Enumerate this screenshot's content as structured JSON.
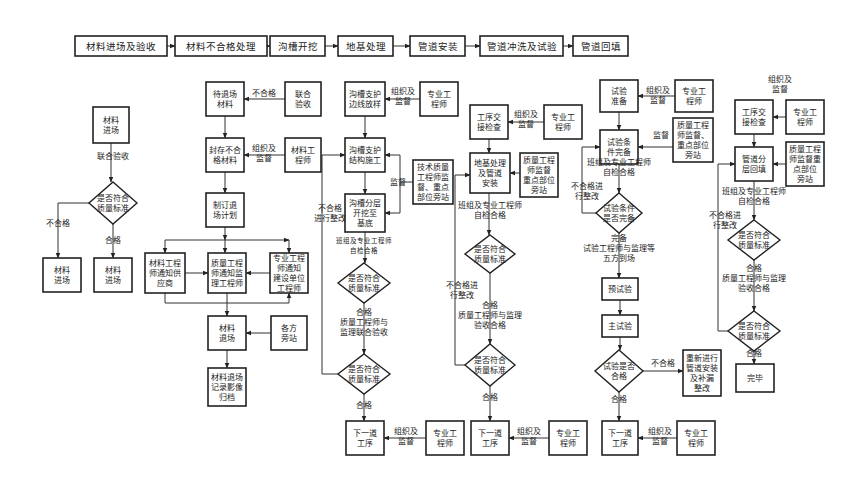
{
  "process_bar": {
    "steps": [
      {
        "id": "s1",
        "label": "材料进场及验收",
        "x": 75,
        "y": 36,
        "w": 92,
        "h": 20
      },
      {
        "id": "s2",
        "label": "材料不合格处理",
        "x": 175,
        "y": 36,
        "w": 92,
        "h": 20
      },
      {
        "id": "s3",
        "label": "沟槽开挖",
        "x": 270,
        "y": 36,
        "w": 55,
        "h": 20
      },
      {
        "id": "s4",
        "label": "地基处理",
        "x": 338,
        "y": 36,
        "w": 55,
        "h": 20
      },
      {
        "id": "s5",
        "label": "管道安装",
        "x": 410,
        "y": 36,
        "w": 55,
        "h": 20
      },
      {
        "id": "s6",
        "label": "管道冲洗及试验",
        "x": 480,
        "y": 36,
        "w": 83,
        "h": 20
      },
      {
        "id": "s7",
        "label": "管道回填",
        "x": 573,
        "y": 36,
        "w": 55,
        "h": 20
      }
    ]
  },
  "nodes": [
    {
      "id": "a1",
      "shape": "box",
      "lines": [
        "材料",
        "进场"
      ],
      "x": 93,
      "y": 107,
      "w": 36,
      "h": 36
    },
    {
      "id": "a2",
      "shape": "diamond",
      "lines": [
        "是否符合",
        "质量标准"
      ],
      "cx": 113,
      "cy": 203,
      "w": 48,
      "h": 42
    },
    {
      "id": "a3",
      "shape": "box",
      "lines": [
        "材料",
        "进场"
      ],
      "x": 43,
      "y": 258,
      "w": 38,
      "h": 34
    },
    {
      "id": "a4",
      "shape": "box",
      "lines": [
        "材料",
        "进场"
      ],
      "x": 94,
      "y": 258,
      "w": 38,
      "h": 34
    },
    {
      "id": "b1",
      "shape": "box",
      "lines": [
        "待退场",
        "材料"
      ],
      "x": 206,
      "y": 82,
      "w": 38,
      "h": 34
    },
    {
      "id": "b2",
      "shape": "box",
      "lines": [
        "联合",
        "验收"
      ],
      "x": 285,
      "y": 82,
      "w": 36,
      "h": 34
    },
    {
      "id": "b3",
      "shape": "box",
      "lines": [
        "封存不合",
        "格材料"
      ],
      "x": 206,
      "y": 138,
      "w": 38,
      "h": 34
    },
    {
      "id": "b4",
      "shape": "box",
      "lines": [
        "材料工",
        "程师"
      ],
      "x": 285,
      "y": 138,
      "w": 36,
      "h": 34
    },
    {
      "id": "b5",
      "shape": "box",
      "lines": [
        "制订退",
        "场计划"
      ],
      "x": 206,
      "y": 193,
      "w": 38,
      "h": 34
    },
    {
      "id": "b6",
      "shape": "box",
      "lines": [
        "材料工程",
        "师通知供",
        "应商"
      ],
      "x": 145,
      "y": 253,
      "w": 40,
      "h": 40
    },
    {
      "id": "b7",
      "shape": "box",
      "lines": [
        "质量工程",
        "师通知监",
        "理工程师"
      ],
      "x": 208,
      "y": 253,
      "w": 38,
      "h": 40
    },
    {
      "id": "b8",
      "shape": "box",
      "lines": [
        "专业工程",
        "师通知",
        "建设单位",
        "工程师"
      ],
      "x": 270,
      "y": 253,
      "w": 38,
      "h": 40
    },
    {
      "id": "b9",
      "shape": "box",
      "lines": [
        "材料",
        "退场"
      ],
      "x": 208,
      "y": 316,
      "w": 38,
      "h": 34
    },
    {
      "id": "b10",
      "shape": "box",
      "lines": [
        "各方",
        "旁站"
      ],
      "x": 271,
      "y": 316,
      "w": 36,
      "h": 34
    },
    {
      "id": "b11",
      "shape": "box",
      "lines": [
        "材料退场",
        "记录影像",
        "归档"
      ],
      "x": 208,
      "y": 368,
      "w": 38,
      "h": 38
    },
    {
      "id": "c1",
      "shape": "box",
      "lines": [
        "沟槽支护",
        "边线放样"
      ],
      "x": 345,
      "y": 82,
      "w": 40,
      "h": 34
    },
    {
      "id": "c2",
      "shape": "box",
      "lines": [
        "专业工",
        "程师"
      ],
      "x": 420,
      "y": 82,
      "w": 38,
      "h": 34
    },
    {
      "id": "c3",
      "shape": "box",
      "lines": [
        "沟槽支护",
        "结构施工"
      ],
      "x": 345,
      "y": 138,
      "w": 40,
      "h": 34
    },
    {
      "id": "c4",
      "shape": "box",
      "lines": [
        "技术质量",
        "工程师监",
        "督、重点",
        "部位旁站"
      ],
      "x": 413,
      "y": 160,
      "w": 40,
      "h": 44
    },
    {
      "id": "c5",
      "shape": "box",
      "lines": [
        "沟槽分层",
        "开挖至",
        "基底"
      ],
      "x": 345,
      "y": 194,
      "w": 40,
      "h": 38
    },
    {
      "id": "c6",
      "shape": "diamond",
      "lines": [
        "是否符合",
        "质量标准"
      ],
      "cx": 364,
      "cy": 283,
      "w": 52,
      "h": 40
    },
    {
      "id": "c7",
      "shape": "diamond",
      "lines": [
        "是否符合",
        "质量标准"
      ],
      "cx": 364,
      "cy": 374,
      "w": 52,
      "h": 40
    },
    {
      "id": "c8",
      "shape": "box",
      "lines": [
        "下一道",
        "工序"
      ],
      "x": 346,
      "y": 421,
      "w": 38,
      "h": 34
    },
    {
      "id": "c9",
      "shape": "box",
      "lines": [
        "专业工",
        "程师"
      ],
      "x": 426,
      "y": 421,
      "w": 38,
      "h": 34
    },
    {
      "id": "d1",
      "shape": "box",
      "lines": [
        "工序交",
        "接检查"
      ],
      "x": 470,
      "y": 105,
      "w": 38,
      "h": 34
    },
    {
      "id": "d2",
      "shape": "box",
      "lines": [
        "专业工",
        "程师"
      ],
      "x": 544,
      "y": 105,
      "w": 38,
      "h": 34
    },
    {
      "id": "d3",
      "shape": "box",
      "lines": [
        "地基处理",
        "及管道",
        "安装"
      ],
      "x": 470,
      "y": 153,
      "w": 40,
      "h": 40
    },
    {
      "id": "d4",
      "shape": "box",
      "lines": [
        "质量工程",
        "师监督",
        "重点部位",
        "旁站"
      ],
      "x": 520,
      "y": 153,
      "w": 38,
      "h": 44
    },
    {
      "id": "d5",
      "shape": "diamond",
      "lines": [
        "是否符合",
        "质量标准"
      ],
      "cx": 490,
      "cy": 254,
      "w": 50,
      "h": 38
    },
    {
      "id": "d6",
      "shape": "diamond",
      "lines": [
        "是否符合",
        "质量标准"
      ],
      "cx": 490,
      "cy": 365,
      "w": 50,
      "h": 42
    },
    {
      "id": "d7",
      "shape": "box",
      "lines": [
        "下一道",
        "工序"
      ],
      "x": 471,
      "y": 421,
      "w": 38,
      "h": 34
    },
    {
      "id": "d8",
      "shape": "box",
      "lines": [
        "专业工",
        "程师"
      ],
      "x": 549,
      "y": 421,
      "w": 38,
      "h": 34
    },
    {
      "id": "e1",
      "shape": "box",
      "lines": [
        "试验",
        "准备"
      ],
      "x": 600,
      "y": 80,
      "w": 38,
      "h": 32
    },
    {
      "id": "e2",
      "shape": "box",
      "lines": [
        "专业工",
        "程师"
      ],
      "x": 675,
      "y": 80,
      "w": 38,
      "h": 32
    },
    {
      "id": "e3",
      "shape": "box",
      "lines": [
        "试验条",
        "件完备"
      ],
      "x": 600,
      "y": 130,
      "w": 38,
      "h": 34
    },
    {
      "id": "e4",
      "shape": "box",
      "lines": [
        "质量工程",
        "师监督、",
        "重点部位",
        "旁站"
      ],
      "x": 673,
      "y": 118,
      "w": 40,
      "h": 44
    },
    {
      "id": "e5",
      "shape": "diamond",
      "lines": [
        "试验条件",
        "是否完备"
      ],
      "cx": 619,
      "cy": 213,
      "w": 46,
      "h": 40
    },
    {
      "id": "e6",
      "shape": "box",
      "lines": [
        "预试验"
      ],
      "x": 602,
      "y": 278,
      "w": 36,
      "h": 22
    },
    {
      "id": "e7",
      "shape": "box",
      "lines": [
        "主试验"
      ],
      "x": 602,
      "y": 315,
      "w": 36,
      "h": 22
    },
    {
      "id": "e8",
      "shape": "diamond",
      "lines": [
        "试验是否",
        "合格"
      ],
      "cx": 619,
      "cy": 371,
      "w": 48,
      "h": 42
    },
    {
      "id": "e9",
      "shape": "box",
      "lines": [
        "重新进行",
        "管道安装",
        "及补漏",
        "整改"
      ],
      "x": 683,
      "y": 350,
      "w": 38,
      "h": 46
    },
    {
      "id": "e10",
      "shape": "box",
      "lines": [
        "下一道",
        "工序"
      ],
      "x": 602,
      "y": 421,
      "w": 36,
      "h": 34
    },
    {
      "id": "e11",
      "shape": "box",
      "lines": [
        "专业工",
        "程师"
      ],
      "x": 677,
      "y": 421,
      "w": 38,
      "h": 34
    },
    {
      "id": "f1",
      "shape": "box",
      "lines": [
        "工序交",
        "接检查"
      ],
      "x": 735,
      "y": 100,
      "w": 38,
      "h": 34
    },
    {
      "id": "f2",
      "shape": "box",
      "lines": [
        "专业工",
        "程师"
      ],
      "x": 786,
      "y": 100,
      "w": 38,
      "h": 34
    },
    {
      "id": "f3",
      "shape": "box",
      "lines": [
        "管道分",
        "层回填"
      ],
      "x": 735,
      "y": 147,
      "w": 38,
      "h": 34
    },
    {
      "id": "f4",
      "shape": "box",
      "lines": [
        "质量工程",
        "师监督重",
        "点部位",
        "旁站"
      ],
      "x": 786,
      "y": 142,
      "w": 38,
      "h": 44
    },
    {
      "id": "f5",
      "shape": "diamond",
      "lines": [
        "是否符合",
        "质量标准"
      ],
      "cx": 754,
      "cy": 240,
      "w": 52,
      "h": 40
    },
    {
      "id": "f6",
      "shape": "diamond",
      "lines": [
        "是否符合",
        "质量标准"
      ],
      "cx": 754,
      "cy": 331,
      "w": 52,
      "h": 40
    },
    {
      "id": "f7",
      "shape": "box",
      "lines": [
        "完毕"
      ],
      "x": 736,
      "y": 364,
      "w": 38,
      "h": 28
    }
  ],
  "labels": [
    {
      "text": "联合验收",
      "x": 113,
      "y": 159
    },
    {
      "text": "不合格",
      "x": 58,
      "y": 226
    },
    {
      "text": "合格",
      "x": 113,
      "y": 243
    },
    {
      "text": "不合格",
      "x": 264,
      "y": 96
    },
    {
      "text": "组织及",
      "x": 264,
      "y": 151
    },
    {
      "text": "监督",
      "x": 264,
      "y": 161
    },
    {
      "text": "组织及",
      "x": 403,
      "y": 94
    },
    {
      "text": "监督",
      "x": 403,
      "y": 104
    },
    {
      "text": "监督",
      "x": 398,
      "y": 185
    },
    {
      "text": "不合格",
      "x": 330,
      "y": 211
    },
    {
      "text": "进行整改",
      "x": 330,
      "y": 221
    },
    {
      "text": "班组及专业工程师",
      "x": 364,
      "y": 243,
      "small": true
    },
    {
      "text": "自检合格",
      "x": 364,
      "y": 253,
      "small": true
    },
    {
      "text": "合格",
      "x": 364,
      "y": 315
    },
    {
      "text": "质量工程师与",
      "x": 364,
      "y": 325
    },
    {
      "text": "监理联合验收",
      "x": 364,
      "y": 335
    },
    {
      "text": "合格",
      "x": 364,
      "y": 408
    },
    {
      "text": "组织及",
      "x": 406,
      "y": 434
    },
    {
      "text": "监督",
      "x": 406,
      "y": 444
    },
    {
      "text": "组织及",
      "x": 526,
      "y": 117
    },
    {
      "text": "监督",
      "x": 526,
      "y": 127
    },
    {
      "text": "班组及专业工程师",
      "x": 490,
      "y": 208
    },
    {
      "text": "自检合格",
      "x": 490,
      "y": 218
    },
    {
      "text": "不合格进",
      "x": 462,
      "y": 288
    },
    {
      "text": "行整改",
      "x": 462,
      "y": 298
    },
    {
      "text": "合格",
      "x": 490,
      "y": 308
    },
    {
      "text": "质量工程师与监理",
      "x": 490,
      "y": 318
    },
    {
      "text": "验收合格",
      "x": 490,
      "y": 328
    },
    {
      "text": "合格",
      "x": 490,
      "y": 400
    },
    {
      "text": "组织及",
      "x": 529,
      "y": 434
    },
    {
      "text": "监督",
      "x": 529,
      "y": 444
    },
    {
      "text": "组织及",
      "x": 658,
      "y": 93
    },
    {
      "text": "监督",
      "x": 658,
      "y": 103
    },
    {
      "text": "监督",
      "x": 661,
      "y": 138
    },
    {
      "text": "班组及专业工程师",
      "x": 619,
      "y": 165
    },
    {
      "text": "自检合格",
      "x": 619,
      "y": 175
    },
    {
      "text": "不合格进",
      "x": 587,
      "y": 189
    },
    {
      "text": "行整改",
      "x": 587,
      "y": 199
    },
    {
      "text": "完备",
      "x": 619,
      "y": 241
    },
    {
      "text": "试验工程师与监理等",
      "x": 619,
      "y": 251
    },
    {
      "text": "五方到场",
      "x": 619,
      "y": 261
    },
    {
      "text": "不合格",
      "x": 663,
      "y": 366
    },
    {
      "text": "合格",
      "x": 619,
      "y": 402
    },
    {
      "text": "组织及",
      "x": 660,
      "y": 434
    },
    {
      "text": "监督",
      "x": 660,
      "y": 444
    },
    {
      "text": "组织及",
      "x": 780,
      "y": 82
    },
    {
      "text": "监督",
      "x": 780,
      "y": 92
    },
    {
      "text": "班组及专业工程师",
      "x": 754,
      "y": 194
    },
    {
      "text": "自检合格",
      "x": 754,
      "y": 204
    },
    {
      "text": "不合格进",
      "x": 725,
      "y": 218
    },
    {
      "text": "行整改",
      "x": 725,
      "y": 228
    },
    {
      "text": "合格",
      "x": 754,
      "y": 271
    },
    {
      "text": "质量工程师与监理",
      "x": 754,
      "y": 281
    },
    {
      "text": "验收合格",
      "x": 754,
      "y": 291
    },
    {
      "text": "合格",
      "x": 754,
      "y": 356
    }
  ],
  "edges": [
    [
      [
        167,
        46
      ],
      [
        175,
        46
      ]
    ],
    [
      [
        267,
        46
      ],
      [
        270,
        46
      ]
    ],
    [
      [
        325,
        46
      ],
      [
        338,
        46
      ]
    ],
    [
      [
        393,
        46
      ],
      [
        410,
        46
      ]
    ],
    [
      [
        465,
        46
      ],
      [
        480,
        46
      ]
    ],
    [
      [
        563,
        46
      ],
      [
        573,
        46
      ]
    ],
    [
      [
        111,
        143
      ],
      [
        111,
        182
      ]
    ],
    [
      [
        89,
        203
      ],
      [
        58,
        203
      ],
      [
        58,
        258
      ]
    ],
    [
      [
        113,
        224
      ],
      [
        113,
        258
      ]
    ],
    [
      [
        285,
        99
      ],
      [
        244,
        99
      ]
    ],
    [
      [
        225,
        116
      ],
      [
        225,
        138
      ]
    ],
    [
      [
        285,
        155
      ],
      [
        244,
        155
      ]
    ],
    [
      [
        225,
        172
      ],
      [
        225,
        193
      ]
    ],
    [
      [
        225,
        227
      ],
      [
        225,
        240
      ]
    ],
    [
      [
        165,
        240
      ],
      [
        289,
        240
      ]
    ],
    [
      [
        165,
        240
      ],
      [
        165,
        253
      ]
    ],
    [
      [
        225,
        240
      ],
      [
        225,
        253
      ]
    ],
    [
      [
        289,
        240
      ],
      [
        289,
        253
      ]
    ],
    [
      [
        185,
        273
      ],
      [
        208,
        273
      ]
    ],
    [
      [
        270,
        273
      ],
      [
        246,
        273
      ]
    ],
    [
      [
        165,
        293
      ],
      [
        165,
        303
      ],
      [
        289,
        303
      ],
      [
        289,
        293
      ]
    ],
    [
      [
        227,
        293
      ],
      [
        227,
        316
      ]
    ],
    [
      [
        271,
        333
      ],
      [
        246,
        333
      ]
    ],
    [
      [
        227,
        350
      ],
      [
        227,
        368
      ]
    ],
    [
      [
        420,
        99
      ],
      [
        385,
        99
      ]
    ],
    [
      [
        365,
        116
      ],
      [
        365,
        138
      ]
    ],
    [
      [
        365,
        172
      ],
      [
        365,
        194
      ]
    ],
    [
      [
        413,
        182
      ],
      [
        400,
        182
      ],
      [
        400,
        155
      ],
      [
        385,
        155
      ]
    ],
    [
      [
        400,
        182
      ],
      [
        400,
        213
      ],
      [
        385,
        213
      ]
    ],
    [
      [
        365,
        232
      ],
      [
        365,
        263
      ]
    ],
    [
      [
        338,
        374
      ],
      [
        322,
        374
      ],
      [
        322,
        155
      ],
      [
        345,
        155
      ]
    ],
    [
      [
        364,
        303
      ],
      [
        364,
        354
      ]
    ],
    [
      [
        364,
        394
      ],
      [
        364,
        421
      ]
    ],
    [
      [
        426,
        438
      ],
      [
        384,
        438
      ]
    ],
    [
      [
        544,
        122
      ],
      [
        508,
        122
      ]
    ],
    [
      [
        489,
        139
      ],
      [
        489,
        153
      ]
    ],
    [
      [
        520,
        173
      ],
      [
        510,
        173
      ]
    ],
    [
      [
        489,
        193
      ],
      [
        489,
        235
      ]
    ],
    [
      [
        465,
        365
      ],
      [
        455,
        365
      ],
      [
        455,
        175
      ],
      [
        470,
        175
      ]
    ],
    [
      [
        490,
        273
      ],
      [
        490,
        344
      ]
    ],
    [
      [
        490,
        386
      ],
      [
        490,
        421
      ]
    ],
    [
      [
        549,
        438
      ],
      [
        509,
        438
      ]
    ],
    [
      [
        675,
        96
      ],
      [
        638,
        96
      ]
    ],
    [
      [
        619,
        112
      ],
      [
        619,
        130
      ]
    ],
    [
      [
        673,
        147
      ],
      [
        638,
        147
      ]
    ],
    [
      [
        619,
        164
      ],
      [
        619,
        193
      ]
    ],
    [
      [
        596,
        213
      ],
      [
        582,
        213
      ],
      [
        582,
        147
      ],
      [
        600,
        147
      ]
    ],
    [
      [
        619,
        233
      ],
      [
        619,
        278
      ]
    ],
    [
      [
        620,
        300
      ],
      [
        620,
        315
      ]
    ],
    [
      [
        620,
        337
      ],
      [
        620,
        350
      ]
    ],
    [
      [
        643,
        371
      ],
      [
        683,
        371
      ]
    ],
    [
      [
        619,
        392
      ],
      [
        619,
        421
      ]
    ],
    [
      [
        677,
        438
      ],
      [
        638,
        438
      ]
    ],
    [
      [
        786,
        117
      ],
      [
        773,
        117
      ]
    ],
    [
      [
        754,
        134
      ],
      [
        754,
        147
      ]
    ],
    [
      [
        786,
        164
      ],
      [
        773,
        164
      ]
    ],
    [
      [
        754,
        181
      ],
      [
        754,
        220
      ]
    ],
    [
      [
        728,
        331
      ],
      [
        718,
        331
      ],
      [
        718,
        164
      ],
      [
        735,
        164
      ]
    ],
    [
      [
        754,
        260
      ],
      [
        754,
        311
      ]
    ],
    [
      [
        754,
        351
      ],
      [
        754,
        364
      ]
    ]
  ]
}
